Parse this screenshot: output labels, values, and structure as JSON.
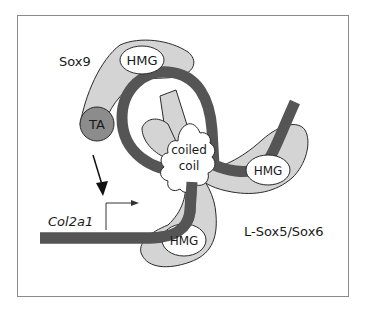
{
  "figure": {
    "labels": {
      "sox9": "Sox9",
      "sox9_hmg": "HMG",
      "ta": "TA",
      "coiled_line1": "coiled",
      "coiled_line2": "coil",
      "sox56_hmg_right": "HMG",
      "sox56_hmg_bottom": "HMG",
      "sox56": "L-Sox5/Sox6",
      "gene": "Col2a1"
    },
    "colors": {
      "frame": "#8a8a8a",
      "protein_fill": "#d4d4d4",
      "outline": "#2a2a2a",
      "dna": "#555555",
      "ta_fill": "#8c8c8c",
      "domain_fill": "#ffffff"
    }
  }
}
